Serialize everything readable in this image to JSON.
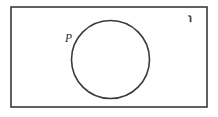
{
  "diagram": {
    "type": "venn-diagram",
    "background_color": "#ffffff",
    "stroke_color": "#3a3a3a",
    "universe": {
      "shape": "rectangle",
      "label": "℩",
      "label_meaning": "universal-set-symbol",
      "label_position": "top-right",
      "x": 11,
      "y": 7,
      "width": 196,
      "height": 100,
      "stroke_width": 1.6
    },
    "sets": [
      {
        "name": "P",
        "label": "P",
        "shape": "circle",
        "cx": 110.5,
        "cy": 59.5,
        "r": 39,
        "stroke_width": 1.6,
        "fill": "none",
        "label_x": 65,
        "label_y": 42,
        "label_font_size": 11
      }
    ]
  }
}
